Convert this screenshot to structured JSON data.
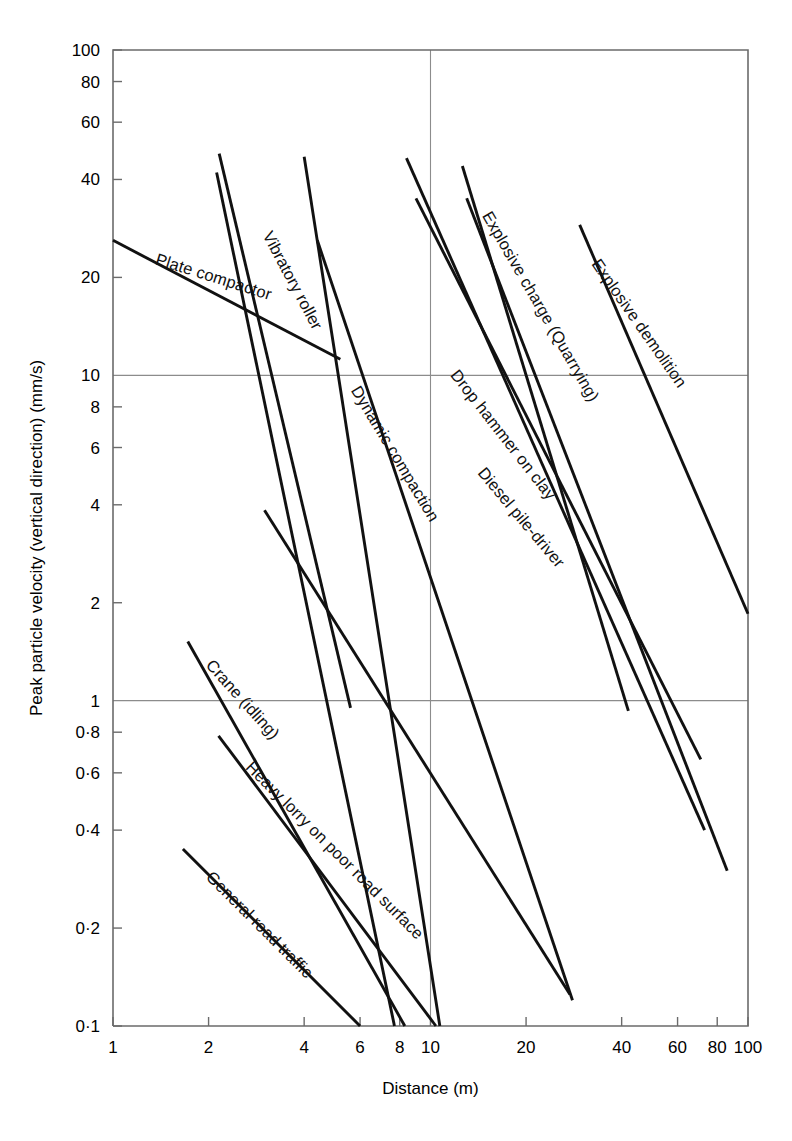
{
  "chart_data": {
    "type": "line",
    "title": "",
    "xlabel": "Distance (m)",
    "ylabel": "Peak particle velocity (vertical direction) (mm/s)",
    "xscale": "log",
    "yscale": "log",
    "xlim": [
      1,
      100
    ],
    "ylim": [
      0.1,
      100
    ],
    "grid": true,
    "gridlines": {
      "x": [
        10
      ],
      "y": [
        1,
        10
      ]
    },
    "xticks": [
      1,
      2,
      4,
      6,
      8,
      10,
      20,
      40,
      60,
      80,
      100
    ],
    "xticklabels": [
      "1",
      "2",
      "4",
      "6",
      "8",
      "10",
      "20",
      "40",
      "60",
      "80",
      "100"
    ],
    "yticks": [
      0.1,
      0.2,
      0.4,
      0.6,
      0.8,
      1,
      2,
      4,
      6,
      8,
      10,
      20,
      40,
      60,
      80,
      100
    ],
    "yticklabels": [
      "0·1",
      "0·2",
      "0·4",
      "0·6",
      "0·8",
      "1",
      "2",
      "4",
      "6",
      "8",
      "10",
      "20",
      "40",
      "60",
      "80",
      "100"
    ],
    "legend": "inline-labels",
    "series": [
      {
        "name": "Plate compactor",
        "label": "Plate compactor",
        "points": [
          [
            1.0,
            26.0
          ],
          [
            5.2,
            11.2
          ]
        ],
        "label_anchor": [
          1.35,
          22.0
        ],
        "label_rotation": 17.5
      },
      {
        "name": "Vibratory roller",
        "label": "Vibratory roller",
        "points": [
          [
            2.16,
            48.0
          ],
          [
            5.6,
            0.95
          ]
        ],
        "label_anchor": [
          2.95,
          27.0
        ],
        "label_rotation": 62.0
      },
      {
        "name": "Vibratory roller upper bound",
        "label": "",
        "points": [
          [
            2.12,
            42.0
          ],
          [
            7.7,
            0.1
          ]
        ],
        "label_anchor": null,
        "label_rotation": 0
      },
      {
        "name": "Dynamic compaction",
        "label": "Dynamic compaction",
        "points": [
          [
            4.0,
            47.0
          ],
          [
            10.7,
            0.1
          ]
        ],
        "label_anchor": [
          5.6,
          9.0
        ],
        "label_rotation": 59.0
      },
      {
        "name": "Dynamic compaction lower bound",
        "label": "",
        "points": [
          [
            4.4,
            26.0
          ],
          [
            28.0,
            0.12
          ]
        ],
        "label_anchor": [
          3.05,
          3.85
        ],
        "label_rotation": 49.0
      },
      {
        "name": "Bulldozer",
        "label": "Bulldozer",
        "points": [
          [
            3.0,
            3.85
          ],
          [
            27.5,
            0.125
          ]
        ],
        "label_anchor": null,
        "label_rotation": 0
      },
      {
        "name": "Drop hammer on clay",
        "label": "Drop hammer on clay",
        "points": [
          [
            8.4,
            46.5
          ],
          [
            73.0,
            0.4
          ]
        ],
        "label_anchor": [
          11.5,
          10.0
        ],
        "label_rotation": 52.0
      },
      {
        "name": "Diesel pile-driver",
        "label": "Diesel pile-driver",
        "points": [
          [
            9.0,
            35.0
          ],
          [
            71.0,
            0.66
          ]
        ],
        "label_anchor": [
          14.0,
          5.0
        ],
        "label_rotation": 50.0
      },
      {
        "name": "Explosive charge (Quarrying)",
        "label": "Explosive charge (Quarrying)",
        "points": [
          [
            12.6,
            44.0
          ],
          [
            42.0,
            0.93
          ]
        ],
        "label_anchor": [
          14.5,
          31.0
        ],
        "label_rotation": 60.0
      },
      {
        "name": "Explosive charge lower bound",
        "label": "",
        "points": [
          [
            13.0,
            35.0
          ],
          [
            86.0,
            0.3
          ]
        ],
        "label_anchor": null,
        "label_rotation": 0
      },
      {
        "name": "Explosive demolition",
        "label": "Explosive demolition",
        "points": [
          [
            29.5,
            29.0
          ],
          [
            100.0,
            1.85
          ]
        ],
        "label_anchor": [
          32.0,
          22.0
        ],
        "label_rotation": 55.0
      },
      {
        "name": "Crane (idling)",
        "label": "Crane (idling)",
        "points": [
          [
            1.72,
            1.52
          ],
          [
            8.3,
            0.1
          ]
        ],
        "label_anchor": [
          1.95,
          1.28
        ],
        "label_rotation": 48.0
      },
      {
        "name": "Heavy lorry on poor road surface",
        "label": "Heavy lorry on poor road surface",
        "points": [
          [
            2.15,
            0.78
          ],
          [
            10.4,
            0.1
          ]
        ],
        "label_anchor": [
          2.6,
          0.62
        ],
        "label_rotation": 45.0
      },
      {
        "name": "General road traffic",
        "label": "General road traffic",
        "points": [
          [
            1.66,
            0.35
          ],
          [
            6.0,
            0.1
          ]
        ],
        "label_anchor": [
          1.95,
          0.285
        ],
        "label_rotation": 45.0
      }
    ]
  }
}
